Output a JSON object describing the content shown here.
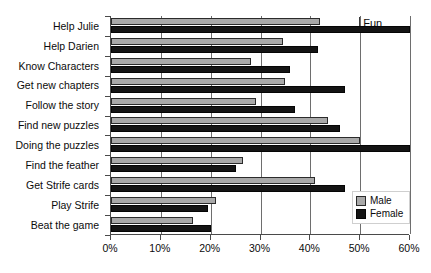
{
  "chart_data": {
    "type": "bar",
    "orientation": "horizontal",
    "title": "",
    "xlabel": "",
    "ylabel": "",
    "xlim": [
      0,
      60
    ],
    "xticks": [
      "0%",
      "10%",
      "20%",
      "30%",
      "40%",
      "50%",
      "60%"
    ],
    "xtick_values": [
      0,
      10,
      20,
      30,
      40,
      50,
      60
    ],
    "grid": true,
    "grid_axis": "x",
    "legend_position": "bottom-right",
    "categories": [
      "Help Julie",
      "Help Darien",
      "Know Characters",
      "Get new chapters",
      "Follow the story",
      "Find new puzzles",
      "Doing the puzzles",
      "Find the feather",
      "Get Strife cards",
      "Play Strife",
      "Beat the game"
    ],
    "series": [
      {
        "name": "Male",
        "color": "#a9a9a9",
        "values": [
          42,
          34.5,
          28,
          35,
          29,
          43.5,
          50,
          26.5,
          41,
          21,
          16.5
        ]
      },
      {
        "name": "Female",
        "color": "#141414",
        "values": [
          60,
          41.5,
          36,
          47,
          37,
          46,
          60,
          25,
          47,
          19.5,
          20
        ]
      }
    ],
    "annotations": [
      {
        "text": "Fun",
        "x": 50,
        "y_index": 0
      }
    ]
  },
  "legend": {
    "items": [
      {
        "label": "Male",
        "color": "#a9a9a9"
      },
      {
        "label": "Female",
        "color": "#141414"
      }
    ]
  }
}
